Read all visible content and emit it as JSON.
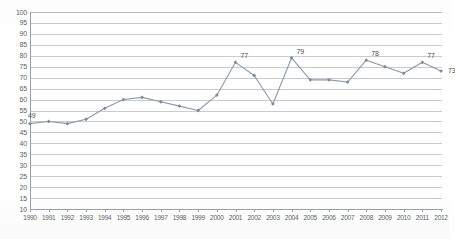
{
  "chart_data": {
    "type": "line",
    "title": "",
    "subtitle": "",
    "xlabel": "",
    "ylabel": "",
    "ylim": [
      10,
      100
    ],
    "y_tick_step": 5,
    "y_ticks": [
      10,
      15,
      20,
      25,
      30,
      35,
      40,
      45,
      50,
      55,
      60,
      65,
      70,
      75,
      80,
      85,
      90,
      95,
      100
    ],
    "grid": true,
    "grid_axis": "y",
    "legend": false,
    "legend_position": "none",
    "marker": "diamond",
    "categories": [
      "1990",
      "1991",
      "1992",
      "1993",
      "1994",
      "1995",
      "1996",
      "1997",
      "1998",
      "1999",
      "2000",
      "2001",
      "2002",
      "2003",
      "2004",
      "2005",
      "2006",
      "2007",
      "2008",
      "2009",
      "2010",
      "2011",
      "2012"
    ],
    "values": [
      49,
      50,
      49,
      51,
      56,
      60,
      61,
      59,
      57,
      55,
      62,
      77,
      71,
      58,
      79,
      69,
      69,
      68,
      78,
      75,
      72,
      77,
      73
    ],
    "series": [
      {
        "name": "series-1",
        "color": "#8c9aa8",
        "values": [
          49,
          50,
          49,
          51,
          56,
          60,
          61,
          59,
          57,
          55,
          62,
          77,
          71,
          58,
          79,
          69,
          69,
          68,
          78,
          75,
          72,
          77,
          73
        ]
      }
    ],
    "data_labels": [
      {
        "category": "1990",
        "value": 49,
        "text": "49",
        "dx": -2,
        "dy": -12
      },
      {
        "category": "2001",
        "value": 77,
        "text": "77",
        "dx": 5,
        "dy": -10
      },
      {
        "category": "2004",
        "value": 79,
        "text": "79",
        "dx": 5,
        "dy": -10
      },
      {
        "category": "2008",
        "value": 78,
        "text": "78",
        "dx": 5,
        "dy": -10
      },
      {
        "category": "2011",
        "value": 77,
        "text": "77",
        "dx": 5,
        "dy": -10
      },
      {
        "category": "2012",
        "value": 73,
        "text": "73",
        "dx": 7,
        "dy": -4
      }
    ],
    "colors": {
      "line": "#8c9aa8",
      "marker": "#7d8c9b",
      "gridline": "#c8ccd2",
      "axis": "#9aa0a8",
      "tick_label": "#5c5f63",
      "data_label": "#4a4d51",
      "background": "#ffffff"
    }
  }
}
